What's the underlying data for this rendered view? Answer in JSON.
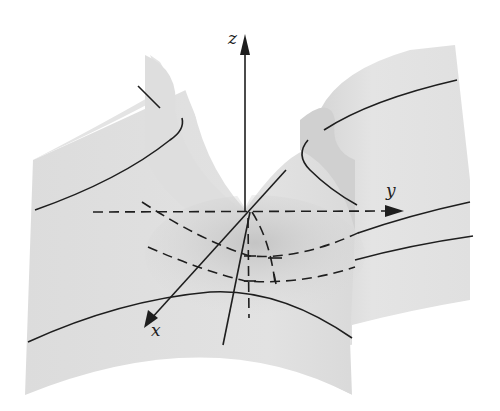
{
  "diagram": {
    "axes": {
      "x": {
        "label": "x"
      },
      "y": {
        "label": "y"
      },
      "z": {
        "label": "z"
      }
    },
    "colors": {
      "background": "#ffffff",
      "surface_light": "#e6e6e6",
      "surface_mid": "#d9d9d9",
      "surface_shadow": "#c8c8c8",
      "ink": "#1e1e1e"
    },
    "elements": [
      "saddle surface",
      "three coordinate axes with arrows",
      "solid level curves on surface",
      "dashed cross-section parabolas and projections"
    ]
  }
}
